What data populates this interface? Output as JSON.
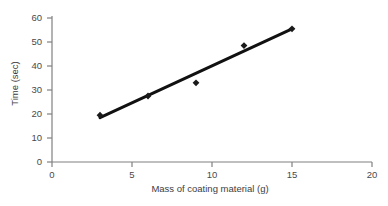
{
  "chart_data": {
    "type": "scatter",
    "title": "",
    "xlabel": "Mass of coating material (g)",
    "ylabel": "Time (sec)",
    "xlim": [
      0,
      20
    ],
    "ylim": [
      0,
      60
    ],
    "xticks": [
      0,
      5,
      10,
      15,
      20
    ],
    "yticks": [
      0,
      10,
      20,
      30,
      40,
      50,
      60
    ],
    "xtick_labels": [
      "0",
      "5",
      "10",
      "15",
      "20"
    ],
    "ytick_labels": [
      "0",
      "10",
      "20",
      "30",
      "40",
      "50",
      "60"
    ],
    "grid": false,
    "legend": false,
    "legend_position": "none",
    "marker": "diamond",
    "marker_color": "#1a1a1a",
    "series": [
      {
        "name": "Time vs mass",
        "x": [
          3,
          6,
          9,
          12,
          15
        ],
        "y": [
          19.5,
          27.5,
          33,
          48.5,
          55.5
        ]
      }
    ],
    "trendline": {
      "type": "linear",
      "x": [
        3,
        15
      ],
      "y": [
        18.5,
        55.5
      ],
      "color": "#111111",
      "width": 3
    },
    "annotations": []
  },
  "axes": {
    "x_title": "Mass of coating material (g)",
    "y_title": "Time (sec)",
    "x_ticks": [
      {
        "value": "0"
      },
      {
        "value": "5"
      },
      {
        "value": "10"
      },
      {
        "value": "15"
      },
      {
        "value": "20"
      }
    ],
    "y_ticks": [
      {
        "value": "60"
      },
      {
        "value": "50"
      },
      {
        "value": "40"
      },
      {
        "value": "30"
      },
      {
        "value": "20"
      },
      {
        "value": "10"
      },
      {
        "value": "0"
      }
    ]
  },
  "colors": {
    "background": "#ffffff",
    "axis": "#808080",
    "text": "#3d3d3d",
    "marker": "#1a1a1a",
    "line": "#111111"
  }
}
